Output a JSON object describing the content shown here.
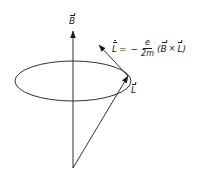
{
  "diagram": {
    "labels": {
      "field_vector": "B",
      "angular_momentum_vector": "L",
      "rate_of_change_vector": "L"
    },
    "formula": {
      "lhs": "L",
      "equals": "=",
      "sign": "−",
      "numerator": "e",
      "denominator": "2m",
      "open_paren": "(",
      "operand_left": "B",
      "operator": "×",
      "operand_right": "L",
      "close_paren": ")"
    },
    "geometry": {
      "origin": [
        73,
        168
      ],
      "b_axis_tip": [
        73,
        32
      ],
      "ellipse_center": [
        73,
        81
      ],
      "ellipse_rx": 58,
      "ellipse_ry": 20,
      "l_vector_tip": [
        128,
        77
      ],
      "l_dot_vector_tip": [
        100,
        46
      ]
    },
    "colors": {
      "ink": "#1a1a1a",
      "background": "#ffffff"
    }
  }
}
